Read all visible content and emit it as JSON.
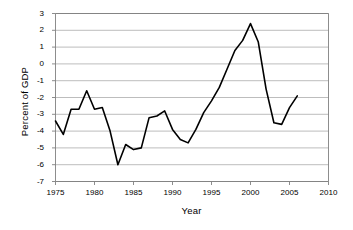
{
  "chart_data": {
    "type": "line",
    "title": "",
    "xlabel": "Year",
    "ylabel": "Percent of GDP",
    "xlim": [
      1975,
      2010
    ],
    "ylim": [
      -7,
      3
    ],
    "xticks": [
      1975,
      1980,
      1985,
      1990,
      1995,
      2000,
      2005,
      2010
    ],
    "yticks": [
      3,
      2,
      1,
      0,
      -1,
      -2,
      -3,
      -4,
      -5,
      -6,
      -7
    ],
    "grid": "horizontal",
    "legend": "none",
    "series": [
      {
        "name": "Percent of GDP",
        "x": [
          1975,
          1976,
          1977,
          1978,
          1979,
          1980,
          1981,
          1982,
          1983,
          1984,
          1985,
          1986,
          1987,
          1988,
          1989,
          1990,
          1991,
          1992,
          1993,
          1994,
          1995,
          1996,
          1997,
          1998,
          1999,
          2000,
          2001,
          2002,
          2003,
          2004,
          2005,
          2006
        ],
        "values": [
          -3.4,
          -4.2,
          -2.7,
          -2.7,
          -1.6,
          -2.7,
          -2.6,
          -4.0,
          -6.0,
          -4.8,
          -5.1,
          -5.0,
          -3.2,
          -3.1,
          -2.8,
          -3.9,
          -4.5,
          -4.7,
          -3.9,
          -2.9,
          -2.2,
          -1.4,
          -0.3,
          0.8,
          1.4,
          2.4,
          1.3,
          -1.5,
          -3.5,
          -3.6,
          -2.6,
          -1.9
        ]
      }
    ],
    "line_color": "#000000",
    "line_width": 1.6,
    "grid_color": "#a0a0a0",
    "axis_color": "#808080",
    "plot_bg": "#ffffff"
  },
  "axis_titles": {
    "y": "Percent of GDP",
    "x": "Year"
  }
}
